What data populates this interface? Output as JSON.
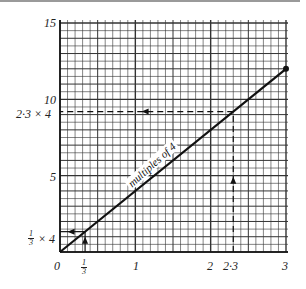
{
  "chart_data": {
    "type": "line",
    "title": "",
    "xlabel": "",
    "ylabel": "",
    "xlim": [
      0,
      3
    ],
    "ylim": [
      0,
      15
    ],
    "grid": true,
    "x_ticks": [
      "0",
      "1/3",
      "1",
      "2",
      "2·3",
      "3"
    ],
    "y_ticks": [
      "1/3 × 4",
      "5",
      "2·3 × 4",
      "10",
      "15"
    ],
    "series": [
      {
        "name": "multiples of 4",
        "x": [
          0,
          3
        ],
        "y": [
          0,
          12
        ]
      }
    ],
    "annotations": [
      {
        "type": "dashed-arrow",
        "from": [
          2.3,
          0
        ],
        "to": [
          2.3,
          9.2
        ],
        "direction": "up"
      },
      {
        "type": "dashed-arrow",
        "from": [
          2.3,
          9.2
        ],
        "to": [
          0,
          9.2
        ],
        "direction": "left",
        "label": "2·3 × 4"
      },
      {
        "type": "arrow",
        "from": [
          0.333,
          0
        ],
        "to": [
          0.333,
          1.333
        ],
        "direction": "up"
      },
      {
        "type": "arrow",
        "from": [
          0.333,
          1.333
        ],
        "to": [
          0,
          1.333
        ],
        "direction": "left",
        "label": "1/3 × 4"
      },
      {
        "type": "point",
        "at": [
          3,
          12
        ]
      }
    ]
  },
  "labels": {
    "y15": "15",
    "y10": "10",
    "y5": "5",
    "y_2_3_x4": "2·3  ×  4",
    "y_third_x": "× 4",
    "frac_num": "1",
    "frac_den": "3",
    "x0": "0",
    "x1": "1",
    "x2": "2",
    "x2_3": "2·3",
    "x3": "3",
    "line_label": "multiples of 4"
  },
  "colors": {
    "line": "#111111",
    "grid": "#333333",
    "background": "#ffffff"
  }
}
